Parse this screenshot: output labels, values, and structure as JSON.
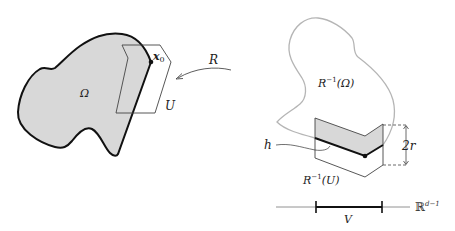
{
  "diagram": {
    "left_panel": {
      "domain_label": "Ω",
      "point_label": "x",
      "point_subscript": "0",
      "neighborhood_label": "U",
      "colors": {
        "fill": "#d8d8d8",
        "boundary": "#111111",
        "box": "#444444"
      }
    },
    "map": {
      "label": "R",
      "direction": "right-to-left"
    },
    "right_panel": {
      "domain_label_base": "R",
      "domain_label_sup": "−1",
      "domain_label_arg": "(Ω)",
      "neighborhood_label_base": "R",
      "neighborhood_label_sup": "−1",
      "neighborhood_label_arg": "(U)",
      "graph_label": "h",
      "height_label": "2r",
      "colors": {
        "outline": "#b5b5b5",
        "fill": "#d8d8d8",
        "graph": "#111111",
        "box": "#444444"
      }
    },
    "axis": {
      "space_label_base": "ℝ",
      "space_label_sup": "d−1",
      "interval_label": "V"
    }
  }
}
